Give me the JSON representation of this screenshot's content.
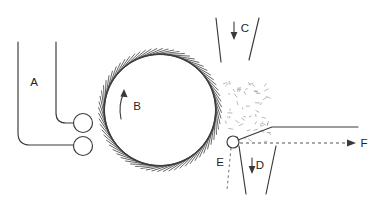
{
  "diagram": {
    "background_color": "#ffffff",
    "line_color": "#3a3a3a",
    "particle_color": "#9a9a9a",
    "width": 380,
    "height": 203,
    "labels": {
      "a": "A",
      "b": "B",
      "c": "C",
      "d": "D",
      "e": "E",
      "f": "F"
    },
    "label_positions": {
      "a": {
        "x": 34,
        "y": 83
      },
      "b": {
        "x": 137,
        "y": 107
      },
      "c": {
        "x": 245,
        "y": 29
      },
      "d": {
        "x": 260,
        "y": 166
      },
      "e": {
        "x": 220,
        "y": 163
      },
      "f": {
        "x": 364,
        "y": 144
      }
    },
    "components": {
      "feed_chute_label": "A",
      "cylinder_label": "B",
      "air_inlet_label": "C",
      "waste_outlet_label": "D",
      "doffing_point_label": "E",
      "output_label": "F"
    },
    "geometry": {
      "cylinder_center_x": 160,
      "cylinder_center_y": 110,
      "cylinder_radius": 56,
      "tooth_count": 68,
      "tooth_length": 5.5,
      "tooth_slant_deg": 34,
      "upper_roller": {
        "cx": 83,
        "cy": 123,
        "r": 9.5
      },
      "lower_roller": {
        "cx": 83,
        "cy": 146,
        "r": 9.5
      },
      "doffer_roller": {
        "cx": 233,
        "cy": 142,
        "r": 6
      },
      "particle_count": 58
    }
  }
}
